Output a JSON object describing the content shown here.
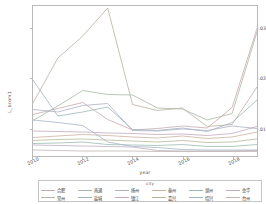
{
  "chart_data": {
    "type": "line",
    "title": "",
    "xlabel": "year",
    "ylabel": "L_bcom1",
    "x": [
      2010,
      2011,
      2012,
      2013,
      2014,
      2015,
      2016,
      2017,
      2018,
      2019
    ],
    "xlim": [
      2010,
      2019
    ],
    "ylim": [
      0.0045,
      0.0345
    ],
    "xticks": [
      2010,
      2012,
      2014,
      2016,
      2018
    ],
    "xtick_labels": [
      "2010",
      "2012",
      "2014",
      "2016",
      "2018"
    ],
    "yticks": [
      0.01,
      0.02,
      0.03
    ],
    "ytick_labels": [
      "0.01",
      "0.02",
      "0.03"
    ],
    "grid": false,
    "legend_title": "city",
    "legend_position": "bottom",
    "legend_columns": 6,
    "legend_rows": 2,
    "series": [
      {
        "name": "合肥",
        "color": "#c9a9ae",
        "values": [
          0.0128,
          0.014,
          0.0152,
          0.0118,
          0.0097,
          0.01,
          0.0105,
          0.0101,
          0.0142,
          0.03
        ]
      },
      {
        "name": "常州",
        "color": "#b9b0a2",
        "values": [
          0.0151,
          0.0241,
          0.0285,
          0.0341,
          0.0148,
          0.0136,
          0.0141,
          0.0104,
          0.0108,
          0.0183
        ]
      },
      {
        "name": "南通",
        "color": "#a9b8a6",
        "values": [
          0.0116,
          0.0145,
          0.0176,
          0.0168,
          0.0167,
          0.0141,
          0.0139,
          0.0117,
          0.013,
          0.0293
        ]
      },
      {
        "name": "盐城",
        "color": "#9fb6bd",
        "values": [
          0.0197,
          0.0125,
          0.0133,
          0.0143,
          0.0098,
          0.0096,
          0.0101,
          0.0094,
          0.0112,
          0.0157
        ]
      },
      {
        "name": "扬州",
        "color": "#aeb0c6",
        "values": [
          0.0138,
          0.0133,
          0.0146,
          0.015,
          0.0096,
          0.0095,
          0.0099,
          0.0096,
          0.0105,
          0.01
        ]
      },
      {
        "name": "镇江",
        "color": "#c4a8c0",
        "values": [
          0.0095,
          0.0094,
          0.0093,
          0.0091,
          0.009,
          0.0088,
          0.0089,
          0.0086,
          0.009,
          0.0104
        ]
      },
      {
        "name": "泰州",
        "color": "#cbb09c",
        "values": [
          0.0082,
          0.0085,
          0.0088,
          0.0086,
          0.0083,
          0.0081,
          0.0085,
          0.008,
          0.0083,
          0.0093
        ]
      },
      {
        "name": "嘉兴",
        "color": "#b5b896",
        "values": [
          0.0076,
          0.0078,
          0.0079,
          0.0077,
          0.0075,
          0.0073,
          0.0076,
          0.0072,
          0.0073,
          0.0079
        ]
      },
      {
        "name": "湖州",
        "color": "#99bbb0",
        "values": [
          0.007,
          0.0071,
          0.0073,
          0.0068,
          0.0067,
          0.0066,
          0.0068,
          0.0064,
          0.0064,
          0.0068
        ]
      },
      {
        "name": "绍兴",
        "color": "#a5b4c8",
        "values": [
          0.0117,
          0.0112,
          0.0106,
          0.0073,
          0.0064,
          0.0062,
          0.0058,
          0.0057,
          0.0057,
          0.0057
        ]
      },
      {
        "name": "金华",
        "color": "#bdacc4",
        "values": [
          0.0067,
          0.0066,
          0.0065,
          0.0064,
          0.0063,
          0.0056,
          0.0055,
          0.0055,
          0.0055,
          0.0056
        ]
      },
      {
        "name": "台州",
        "color": "#c0b5b0",
        "values": [
          0.0057,
          0.0056,
          0.0055,
          0.0055,
          0.0055,
          0.0054,
          0.0054,
          0.0054,
          0.0054,
          0.0054
        ]
      }
    ]
  }
}
